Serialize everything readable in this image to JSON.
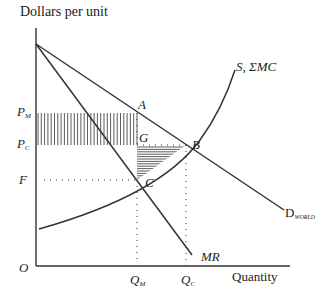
{
  "chart_data": {
    "type": "line",
    "title": "",
    "ylabel": "Dollars per unit",
    "xlabel": "Quantity",
    "origin_label": "O",
    "curves": [
      {
        "name": "D_WORLD",
        "label": "D",
        "label_sub": "WORLD",
        "kind": "linear demand"
      },
      {
        "name": "MR",
        "label": "MR",
        "kind": "marginal revenue"
      },
      {
        "name": "S, ΣMC",
        "label": "S, ΣMC",
        "kind": "supply / sum of marginal cost"
      }
    ],
    "price_levels": [
      {
        "label": "P",
        "sub": "M",
        "name": "P_M"
      },
      {
        "label": "P",
        "sub": "C",
        "name": "P_C"
      },
      {
        "label": "F",
        "sub": "",
        "name": "F"
      }
    ],
    "quantity_levels": [
      {
        "label": "Q",
        "sub": "M",
        "name": "Q_M"
      },
      {
        "label": "Q",
        "sub": "C",
        "name": "Q_C"
      }
    ],
    "points": [
      "A",
      "G",
      "B",
      "C"
    ],
    "shaded_regions": [
      {
        "name": "transfer rectangle",
        "bounds": "P_C to P_M, 0 to Q_M",
        "pattern": "vertical stripes"
      },
      {
        "name": "deadweight triangle",
        "bounds": "G-B-C",
        "pattern": "horizontal stripes"
      }
    ],
    "grid": false
  },
  "labels": {
    "ylabel": "Dollars per unit",
    "xlabel": "Quantity",
    "origin": "O",
    "pm_main": "P",
    "pm_sub": "M",
    "pc_main": "P",
    "pc_sub": "C",
    "f": "F",
    "qm_main": "Q",
    "qm_sub": "M",
    "qc_main": "Q",
    "qc_sub": "C",
    "a": "A",
    "g": "G",
    "b": "B",
    "c": "C",
    "supply": "S, ΣMC",
    "mr": "MR",
    "d_main": "D",
    "d_sub": "WORLD"
  }
}
